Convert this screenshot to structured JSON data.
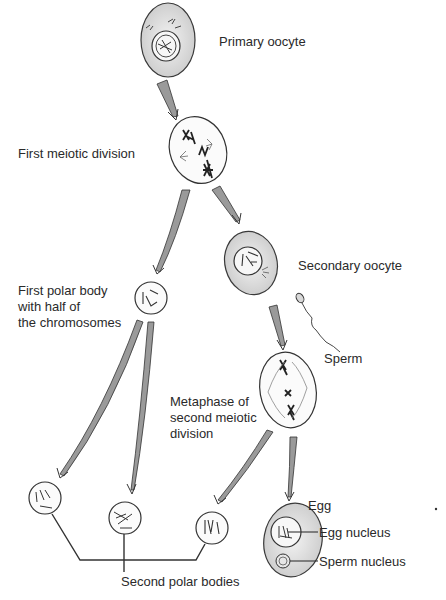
{
  "diagram": {
    "colors": {
      "cell_fill": "#e2e2e2",
      "cell_stroke": "#3a3a3a",
      "arrow_fill": "#9a9a9a",
      "line": "#333333",
      "background": "#ffffff"
    },
    "stages": [
      {
        "id": "primary-oocyte",
        "label": "Primary oocyte"
      },
      {
        "id": "first-meiotic-division",
        "label": "First meiotic division"
      },
      {
        "id": "secondary-oocyte",
        "label": "Secondary oocyte"
      },
      {
        "id": "first-polar-body",
        "label": "First polar body\nwith half of\nthe chromosomes"
      },
      {
        "id": "sperm",
        "label": "Sperm"
      },
      {
        "id": "metaphase-second",
        "label": "Metaphase of\nsecond meiotic\ndivision"
      },
      {
        "id": "egg",
        "label": "Egg"
      },
      {
        "id": "egg-nucleus",
        "label": "Egg nucleus"
      },
      {
        "id": "sperm-nucleus",
        "label": "Sperm nucleus"
      },
      {
        "id": "second-polar-bodies",
        "label": "Second polar bodies"
      }
    ]
  }
}
